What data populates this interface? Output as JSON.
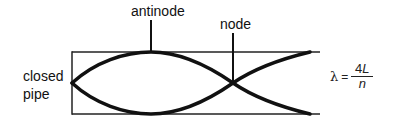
{
  "diagram": {
    "labels": {
      "antinode": "antinode",
      "node": "node",
      "closed_pipe_line1": "closed",
      "closed_pipe_line2": "pipe"
    },
    "formula": {
      "lhs": "λ",
      "equals": "=",
      "numerator_coef": "4",
      "numerator_var": "L",
      "denominator": "n"
    },
    "colors": {
      "stroke": "#111111",
      "background": "#ffffff"
    }
  }
}
